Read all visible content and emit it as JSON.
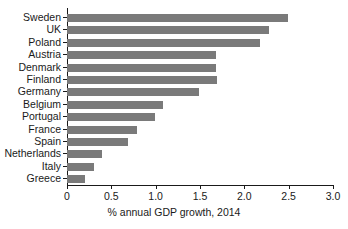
{
  "chart_data": {
    "type": "bar",
    "orientation": "horizontal",
    "title": "",
    "subtitle": "",
    "xlabel": "% annual GDP growth, 2014",
    "ylabel": "",
    "xlim": [
      0,
      3.0
    ],
    "xticks": [
      "0",
      "0.5",
      "1.0",
      "1.5",
      "2.0",
      "2.5",
      "3.0"
    ],
    "xtick_values": [
      0,
      0.5,
      1.0,
      1.5,
      2.0,
      2.5,
      3.0
    ],
    "grid": false,
    "legend": null,
    "bar_color": "#7a7a7a",
    "axis_color": "#1a1a1a",
    "categories": [
      "Sweden",
      "UK",
      "Poland",
      "Austria",
      "Denmark",
      "Finland",
      "Germany",
      "Belgium",
      "Portugal",
      "France",
      "Spain",
      "Netherlands",
      "Italy",
      "Greece"
    ],
    "values": [
      2.49,
      2.28,
      2.18,
      1.68,
      1.68,
      1.69,
      1.49,
      1.08,
      0.99,
      0.79,
      0.69,
      0.4,
      0.3,
      0.2
    ]
  }
}
